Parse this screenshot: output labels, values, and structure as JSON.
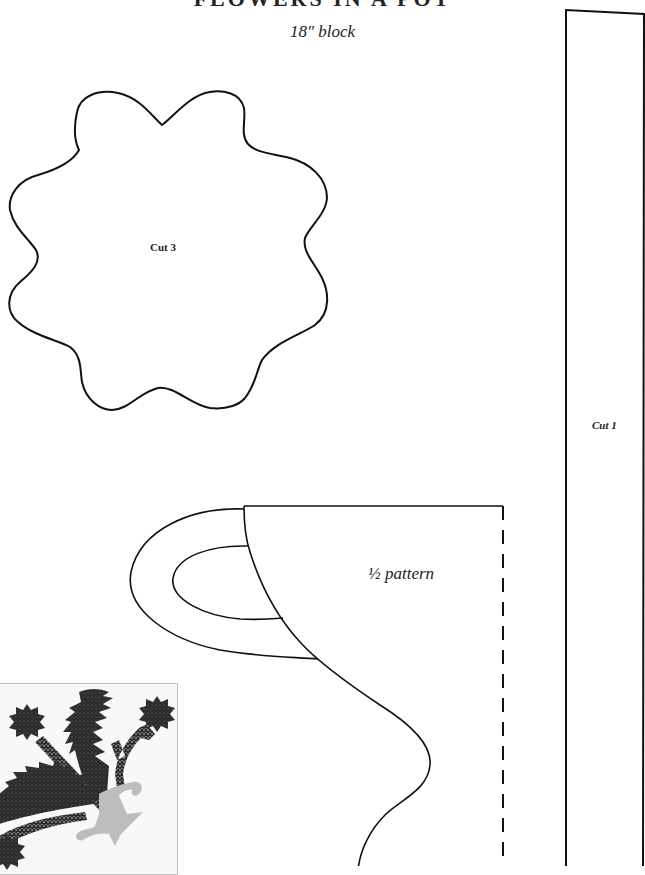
{
  "header": {
    "title": "FLOWERS IN A POT",
    "subtitle": "18″ block"
  },
  "pieces": [
    {
      "name": "flower",
      "label": "Cut 3"
    },
    {
      "name": "strip",
      "label": "Cut 1"
    },
    {
      "name": "pot",
      "label": "½ pattern"
    }
  ],
  "thumbnail": {
    "description": "Finished block preview: dark appliqué flowers and leaves in a light gray pot",
    "colors": {
      "appliqué": "#2b2b2b",
      "pot": "#bdbdbd",
      "background": "#f8f8f8",
      "frame": "#bdbdbd"
    }
  },
  "colors": {
    "line": "#111111",
    "background": "#ffffff"
  }
}
